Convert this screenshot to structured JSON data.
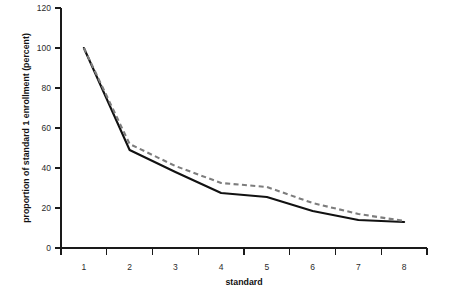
{
  "chart_data": {
    "type": "line",
    "title": "",
    "xlabel": "standard",
    "ylabel": "proportion of standard 1 enrollment (percent)",
    "x": [
      1,
      2,
      3,
      4,
      5,
      6,
      7,
      8
    ],
    "categories": [
      "1",
      "2",
      "3",
      "4",
      "5",
      "6",
      "7",
      "8"
    ],
    "series": [
      {
        "name": "solid",
        "style": "solid",
        "color": "#111111",
        "values": [
          100,
          49,
          38,
          27.5,
          25.5,
          18.5,
          14,
          13
        ]
      },
      {
        "name": "dashed",
        "style": "dashed",
        "color": "#7d7d7d",
        "values": [
          100,
          52,
          41,
          32.5,
          30.5,
          22.5,
          17,
          13.5
        ]
      }
    ],
    "xlim": [
      0.5,
      8.5
    ],
    "ylim": [
      0,
      120
    ],
    "yticks": [
      0,
      20,
      40,
      60,
      80,
      100,
      120
    ],
    "ytick_labels": [
      "0",
      "20",
      "40",
      "60",
      "80",
      "100",
      "120"
    ],
    "xticks": [
      1,
      2,
      3,
      4,
      5,
      6,
      7,
      8
    ],
    "xtick_labels": [
      "1",
      "2",
      "3",
      "4",
      "5",
      "6",
      "7",
      "8"
    ],
    "grid": false,
    "legend": "none"
  },
  "axes": {
    "y_title": "proportion of standard 1 enrollment (percent)",
    "x_title": "standard"
  }
}
